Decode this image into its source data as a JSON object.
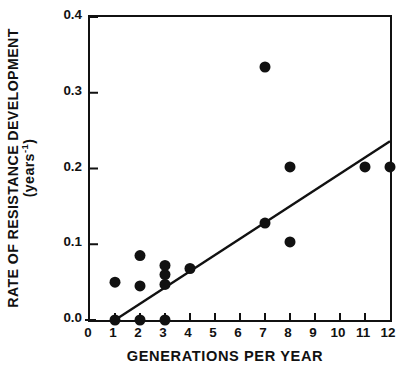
{
  "chart_data": {
    "type": "scatter",
    "title": "",
    "xlabel": "GENERATIONS PER YEAR",
    "ylabel": "RATE OF RESISTANCE DEVELOPMENT",
    "ylabel_units": "(years⁻¹)",
    "ylabel_line1": "RATE OF RESISTANCE DEVELOPMENT",
    "ylabel_line2_prefix": "(years",
    "ylabel_line2_exponent": "-1",
    "ylabel_line2_suffix": ")",
    "xlim": [
      0,
      12
    ],
    "ylim": [
      0.0,
      0.4
    ],
    "xticks": [
      0,
      1,
      2,
      3,
      4,
      5,
      6,
      7,
      8,
      9,
      10,
      11,
      12
    ],
    "xtick_labels": [
      "0",
      "1",
      "2",
      "3",
      "4",
      "5",
      "6",
      "7",
      "8",
      "9",
      "10",
      "11",
      "12"
    ],
    "yticks": [
      0.0,
      0.1,
      0.2,
      0.3,
      0.4
    ],
    "ytick_labels": [
      "0.0",
      "0.1",
      "0.2",
      "0.3",
      "0.4"
    ],
    "grid": false,
    "legend": false,
    "frame": "box",
    "marker": "filled-circle",
    "marker_color": "#111111",
    "marker_size_px": 11,
    "points": [
      {
        "x": 1,
        "y": 0.05
      },
      {
        "x": 1,
        "y": 0.0
      },
      {
        "x": 2,
        "y": 0.085
      },
      {
        "x": 2,
        "y": 0.045
      },
      {
        "x": 2,
        "y": 0.0
      },
      {
        "x": 3,
        "y": 0.072
      },
      {
        "x": 3,
        "y": 0.06
      },
      {
        "x": 3,
        "y": 0.047
      },
      {
        "x": 3,
        "y": 0.0
      },
      {
        "x": 4,
        "y": 0.068
      },
      {
        "x": 7,
        "y": 0.334
      },
      {
        "x": 7,
        "y": 0.128
      },
      {
        "x": 8,
        "y": 0.202
      },
      {
        "x": 8,
        "y": 0.103
      },
      {
        "x": 11,
        "y": 0.202
      },
      {
        "x": 12,
        "y": 0.202
      }
    ],
    "trendline": {
      "type": "line",
      "x_start": 1.0,
      "y_start": 0.0,
      "x_end": 12.0,
      "y_end": 0.236,
      "color": "#111111",
      "width_px": 2.4
    }
  }
}
